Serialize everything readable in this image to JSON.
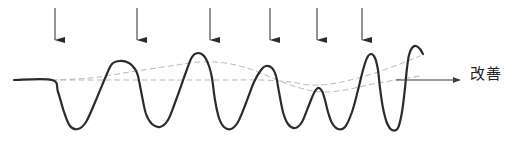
{
  "figure": {
    "kind": "process-improvement-wave-diagram",
    "title_visible": false,
    "background_color": "#ffffff",
    "axis_label": "改善",
    "axis_label_meaning_icon": "right-arrow-icon",
    "colors": {
      "signal_line": "#2b2b2b",
      "axis_line": "#3a3a3a",
      "arrow": "#2b2b2b",
      "dashed_trend": "#b8b8b8",
      "text": "#232323"
    },
    "stroke_widths": {
      "signal_line": 2.2,
      "axis_line": 1.1,
      "arrow_shaft": 1.0,
      "dashed_trend": 1.0
    },
    "dash_pattern": "5 4"
  },
  "chart_data": {
    "type": "line",
    "title": "",
    "subtitle": "",
    "xlabel": "改善",
    "ylabel": "",
    "grid": false,
    "legend_position": "none",
    "xlim": [
      0,
      518
    ],
    "ylim": [
      146,
      0
    ],
    "baseline_y": 80,
    "annotations": [
      {
        "name": "axis-label",
        "text": "改善",
        "x": 470,
        "y": 74
      }
    ],
    "series": [
      {
        "name": "process-signal",
        "style": "solid",
        "color": "#2b2b2b",
        "points": [
          [
            14,
            80
          ],
          [
            52,
            80
          ],
          [
            58,
            92
          ],
          [
            64,
            112
          ],
          [
            70,
            126
          ],
          [
            78,
            129
          ],
          [
            86,
            122
          ],
          [
            96,
            100
          ],
          [
            106,
            76
          ],
          [
            112,
            64
          ],
          [
            120,
            61
          ],
          [
            129,
            63
          ],
          [
            135,
            69
          ],
          [
            138,
            76
          ],
          [
            142,
            96
          ],
          [
            146,
            114
          ],
          [
            152,
            124
          ],
          [
            160,
            127
          ],
          [
            168,
            120
          ],
          [
            176,
            100
          ],
          [
            186,
            72
          ],
          [
            192,
            57
          ],
          [
            198,
            53
          ],
          [
            204,
            56
          ],
          [
            209,
            66
          ],
          [
            212,
            78
          ],
          [
            215,
            100
          ],
          [
            219,
            118
          ],
          [
            224,
            127
          ],
          [
            231,
            129
          ],
          [
            238,
            122
          ],
          [
            246,
            103
          ],
          [
            254,
            82
          ],
          [
            261,
            70
          ],
          [
            266,
            66
          ],
          [
            272,
            68
          ],
          [
            276,
            76
          ],
          [
            279,
            92
          ],
          [
            283,
            112
          ],
          [
            288,
            124
          ],
          [
            295,
            128
          ],
          [
            302,
            122
          ],
          [
            309,
            105
          ],
          [
            314,
            93
          ],
          [
            318,
            88
          ],
          [
            322,
            91
          ],
          [
            325,
            100
          ],
          [
            328,
            112
          ],
          [
            332,
            123
          ],
          [
            338,
            129
          ],
          [
            345,
            127
          ],
          [
            352,
            112
          ],
          [
            358,
            90
          ],
          [
            363,
            70
          ],
          [
            367,
            58
          ],
          [
            371,
            54
          ],
          [
            375,
            58
          ],
          [
            378,
            70
          ],
          [
            380,
            88
          ],
          [
            383,
            108
          ],
          [
            387,
            123
          ],
          [
            392,
            130
          ],
          [
            398,
            128
          ],
          [
            402,
            112
          ],
          [
            405,
            88
          ],
          [
            407,
            68
          ],
          [
            409,
            55
          ],
          [
            412,
            48
          ],
          [
            416,
            46
          ],
          [
            420,
            49
          ],
          [
            423,
            54
          ]
        ]
      },
      {
        "name": "lower-trend-envelope",
        "style": "dashed",
        "color": "#b8b8b8",
        "points": [
          [
            52,
            80
          ],
          [
            110,
            80
          ],
          [
            170,
            80
          ],
          [
            230,
            80
          ],
          [
            262,
            80
          ],
          [
            290,
            82
          ],
          [
            310,
            85
          ],
          [
            330,
            84
          ],
          [
            350,
            80
          ],
          [
            375,
            73
          ],
          [
            400,
            64
          ],
          [
            420,
            56
          ]
        ]
      },
      {
        "name": "upper-trend-envelope",
        "style": "dashed",
        "color": "#b8b8b8",
        "points": [
          [
            52,
            80
          ],
          [
            90,
            78
          ],
          [
            130,
            72
          ],
          [
            170,
            66
          ],
          [
            200,
            62
          ],
          [
            225,
            63
          ],
          [
            250,
            69
          ],
          [
            275,
            79
          ],
          [
            300,
            88
          ],
          [
            322,
            92
          ],
          [
            345,
            90
          ],
          [
            368,
            85
          ],
          [
            395,
            80
          ],
          [
            420,
            76
          ]
        ]
      }
    ],
    "axis_arrow": {
      "name": "improvement-axis-arrow",
      "x_start": 396,
      "x_end": 460,
      "y": 80,
      "direction": "right"
    },
    "down_arrows": {
      "name": "intervention-arrows",
      "count": 6,
      "label": "",
      "y_top": 8,
      "y_tip": 40,
      "x_positions": [
        55,
        137,
        210,
        270,
        317,
        362
      ]
    }
  }
}
